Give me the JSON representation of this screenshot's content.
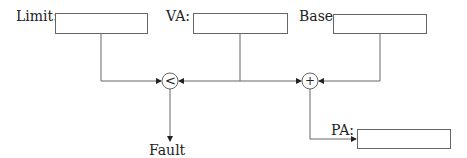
{
  "diagram": {
    "inputs": [
      {
        "id": "limit",
        "label": "Limit:"
      },
      {
        "id": "va",
        "label": "VA:"
      },
      {
        "id": "base",
        "label": "Base:"
      }
    ],
    "output": {
      "id": "pa",
      "label": "PA:"
    },
    "operators": [
      {
        "id": "comparator",
        "symbol": "<"
      },
      {
        "id": "adder",
        "symbol": "+"
      }
    ],
    "fault_label": "Fault",
    "colors": {
      "line": "#666666",
      "text": "#222222",
      "background": "#ffffff"
    }
  }
}
